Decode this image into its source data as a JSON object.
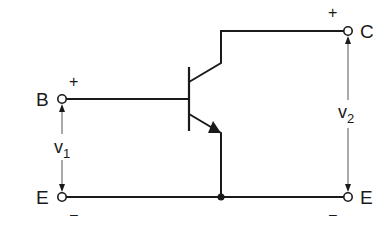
{
  "diagram": {
    "type": "circuit",
    "terminals": {
      "base": "B",
      "collector": "C",
      "emitter_left": "E",
      "emitter_right": "E"
    },
    "voltages": {
      "input": {
        "symbol": "v",
        "subscript": "1"
      },
      "output": {
        "symbol": "v",
        "subscript": "2"
      }
    },
    "polarity": {
      "input_plus": "+",
      "input_minus": "–",
      "output_plus": "+",
      "output_minus": "–"
    },
    "colors": {
      "stroke": "#1a1a1a",
      "thin_stroke": "#555555",
      "background": "#ffffff"
    }
  }
}
